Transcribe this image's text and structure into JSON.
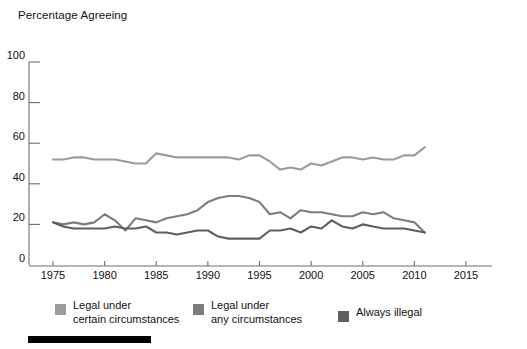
{
  "axis_title": "Percentage\nAgreeing",
  "colors": {
    "series_legal_certain": "#9b9b9b",
    "series_legal_any": "#7d7d7d",
    "series_always_illegal": "#5e5e5e",
    "axis": "#6e6e6e",
    "text": "#111111",
    "background": "#ffffff",
    "bottom_bar": "#000000"
  },
  "legend": {
    "items": [
      {
        "label": "Legal under\ncertain circumstances",
        "color": "#9b9b9b",
        "name": "legal-under-certain-circumstances"
      },
      {
        "label": "Legal under\nany circumstances",
        "color": "#7d7d7d",
        "name": "legal-under-any-circumstances"
      },
      {
        "label": "Always illegal",
        "color": "#5e5e5e",
        "name": "always-illegal"
      }
    ]
  },
  "chart_data": {
    "type": "line",
    "title": "",
    "xlabel": "",
    "ylabel": "Percentage Agreeing",
    "xlim": [
      1973,
      2016
    ],
    "ylim": [
      0,
      100
    ],
    "yticks": [
      0,
      20,
      40,
      60,
      80,
      100
    ],
    "xticks": [
      1975,
      1980,
      1985,
      1990,
      1995,
      2000,
      2005,
      2010,
      2015
    ],
    "grid": false,
    "legend_position": "bottom",
    "x": [
      1975,
      1976,
      1977,
      1978,
      1979,
      1980,
      1981,
      1982,
      1983,
      1984,
      1985,
      1986,
      1987,
      1988,
      1989,
      1990,
      1991,
      1992,
      1993,
      1994,
      1995,
      1996,
      1997,
      1998,
      1999,
      2000,
      2001,
      2002,
      2003,
      2004,
      2005,
      2006,
      2007,
      2008,
      2009,
      2010,
      2011
    ],
    "series": [
      {
        "name": "Legal under certain circumstances",
        "color": "#9b9b9b",
        "values": [
          52,
          52,
          53,
          53,
          52,
          52,
          52,
          51,
          50,
          50,
          55,
          54,
          53,
          53,
          53,
          53,
          53,
          53,
          52,
          54,
          54,
          51,
          47,
          48,
          47,
          50,
          49,
          51,
          53,
          53,
          52,
          53,
          52,
          52,
          54,
          54,
          58
        ]
      },
      {
        "name": "Legal under any circumstances",
        "color": "#7d7d7d",
        "values": [
          21,
          20,
          21,
          20,
          21,
          25,
          22,
          17,
          23,
          22,
          21,
          23,
          24,
          25,
          27,
          31,
          33,
          34,
          34,
          33,
          31,
          25,
          26,
          23,
          27,
          26,
          26,
          25,
          24,
          24,
          26,
          25,
          26,
          23,
          22,
          21,
          16
        ]
      },
      {
        "name": "Always illegal",
        "color": "#5e5e5e",
        "values": [
          21,
          19,
          18,
          18,
          18,
          18,
          19,
          18,
          18,
          19,
          16,
          16,
          15,
          16,
          17,
          17,
          14,
          13,
          13,
          13,
          13,
          17,
          17,
          18,
          16,
          19,
          18,
          22,
          19,
          18,
          20,
          19,
          18,
          18,
          18,
          17,
          16
        ]
      }
    ]
  }
}
